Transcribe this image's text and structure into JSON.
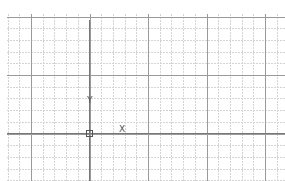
{
  "canvas": {
    "background": "#ffffff",
    "grid": {
      "minor_color": "#cfcfcf",
      "major_color": "#8a8a8a",
      "spacing": 11.7,
      "major_every": 5
    }
  },
  "ucs_icon": {
    "x_label": "X",
    "y_label": "Y",
    "axis_color": "#555555"
  }
}
